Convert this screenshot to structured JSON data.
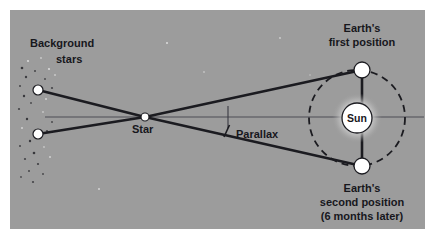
{
  "figure": {
    "title_visible": false,
    "panel": {
      "x": 10,
      "y": 10,
      "width": 415,
      "height": 219,
      "fill": "#9c9c9c",
      "margin_fill": "#ffffff"
    },
    "colors": {
      "background_gray": "#9c9c9c",
      "line_dark": "#1b1b20",
      "axis_gray": "#4d4d55",
      "body_white": "#ffffff",
      "text_dark": "#17171c",
      "sun_glow": "#c9c9c9",
      "margin_white": "#ffffff"
    },
    "labels": {
      "background_stars_line1": "Background",
      "background_stars_line2": "stars",
      "star": "Star",
      "parallax": "Parallax",
      "sun": "Sun",
      "earth_first_line1": "Earth's",
      "earth_first_line2": "first position",
      "earth_second_line1": "Earth's",
      "earth_second_line2": "second position",
      "earth_second_line3": "(6 months later)"
    },
    "bodies": {
      "sun": {
        "cx": 357,
        "cy": 118,
        "r": 15,
        "glow_r": 25,
        "label": "Sun"
      },
      "earth_first": {
        "cx": 362,
        "cy": 70,
        "r": 8
      },
      "earth_second": {
        "cx": 362,
        "cy": 166,
        "r": 8
      },
      "star": {
        "cx": 145,
        "cy": 117,
        "r": 4
      },
      "background_star_upper": {
        "cx": 38,
        "cy": 90,
        "r": 5
      },
      "background_star_lower": {
        "cx": 38,
        "cy": 134,
        "r": 5
      }
    },
    "orbit": {
      "cx": 357,
      "cy": 118,
      "r": 48,
      "style": "dashed",
      "dash_pattern": "7 5",
      "stroke_width": 1.8
    },
    "sight_lines": [
      {
        "name": "upper-sight-line",
        "x1": 38,
        "y1": 90,
        "x2": 362,
        "y2": 70,
        "via_x": 145,
        "via_y": 117
      },
      {
        "name": "lower-sight-line",
        "x1": 38,
        "y1": 134,
        "x2": 362,
        "y2": 166,
        "via_x": 145,
        "via_y": 117
      }
    ],
    "axis": {
      "name": "horizontal-axis",
      "x1": 45,
      "y1": 117,
      "x2": 424,
      "y2": 117,
      "stroke_width": 1.2
    },
    "earth_connector": {
      "x1": 362,
      "y1": 70,
      "x2": 362,
      "y2": 166,
      "stroke_width": 2.6
    },
    "parallax_marker": {
      "tick_x": 228,
      "tick_y1": 106,
      "tick_y2": 128,
      "leader_x1": 224,
      "leader_y1": 137,
      "leader_x2": 229,
      "leader_y2": 126
    },
    "scatter_stars": [
      {
        "cx": 28,
        "cy": 61,
        "r": 1.1
      },
      {
        "cx": 41,
        "cy": 58,
        "r": 0.9
      },
      {
        "cx": 22,
        "cy": 68,
        "r": 1.3
      },
      {
        "cx": 35,
        "cy": 71,
        "r": 1.0
      },
      {
        "cx": 49,
        "cy": 69,
        "r": 1.1
      },
      {
        "cx": 26,
        "cy": 77,
        "r": 1.2
      },
      {
        "cx": 45,
        "cy": 79,
        "r": 0.9
      },
      {
        "cx": 55,
        "cy": 75,
        "r": 1.0
      },
      {
        "cx": 20,
        "cy": 86,
        "r": 1.0
      },
      {
        "cx": 52,
        "cy": 88,
        "r": 1.1
      },
      {
        "cx": 24,
        "cy": 96,
        "r": 1.2
      },
      {
        "cx": 46,
        "cy": 99,
        "r": 1.0
      },
      {
        "cx": 31,
        "cy": 103,
        "r": 0.9
      },
      {
        "cx": 19,
        "cy": 109,
        "r": 1.1
      },
      {
        "cx": 43,
        "cy": 112,
        "r": 0.9
      },
      {
        "cx": 27,
        "cy": 119,
        "r": 1.2
      },
      {
        "cx": 52,
        "cy": 122,
        "r": 1.0
      },
      {
        "cx": 22,
        "cy": 128,
        "r": 1.0
      },
      {
        "cx": 47,
        "cy": 131,
        "r": 1.1
      },
      {
        "cx": 30,
        "cy": 141,
        "r": 1.2
      },
      {
        "cx": 20,
        "cy": 146,
        "r": 1.0
      },
      {
        "cx": 44,
        "cy": 147,
        "r": 0.9
      },
      {
        "cx": 34,
        "cy": 153,
        "r": 1.3
      },
      {
        "cx": 25,
        "cy": 159,
        "r": 1.1
      },
      {
        "cx": 50,
        "cy": 157,
        "r": 1.0
      },
      {
        "cx": 38,
        "cy": 164,
        "r": 1.1
      },
      {
        "cx": 29,
        "cy": 171,
        "r": 1.0
      },
      {
        "cx": 21,
        "cy": 177,
        "r": 0.9
      },
      {
        "cx": 43,
        "cy": 174,
        "r": 1.0
      },
      {
        "cx": 33,
        "cy": 182,
        "r": 1.1
      },
      {
        "cx": 167,
        "cy": 43,
        "r": 1.0
      },
      {
        "cx": 280,
        "cy": 38,
        "r": 0.9
      },
      {
        "cx": 204,
        "cy": 72,
        "r": 0.9
      },
      {
        "cx": 99,
        "cy": 189,
        "r": 1.0
      },
      {
        "cx": 310,
        "cy": 75,
        "r": 0.8
      }
    ],
    "label_positions": {
      "background_stars_line1": {
        "x": 30,
        "y": 47
      },
      "background_stars_line2": {
        "x": 56,
        "y": 63
      },
      "star": {
        "x": 132,
        "y": 132
      },
      "parallax": {
        "x": 236,
        "y": 137
      },
      "sun": {
        "x": 357,
        "y": 122
      },
      "earth_first_line1": {
        "x": 362,
        "y": 31
      },
      "earth_first_line2": {
        "x": 362,
        "y": 45
      },
      "earth_second_line1": {
        "x": 362,
        "y": 191
      },
      "earth_second_line2": {
        "x": 362,
        "y": 205
      },
      "earth_second_line3": {
        "x": 362,
        "y": 219
      }
    },
    "diagram_meta": {
      "type": "astronomy-concept-diagram",
      "concept": "stellar parallax",
      "description": "Two lines of sight from Earth at opposite points of its orbit converge at a nearby star and extend to different background stars, illustrating the parallax shift over six months."
    }
  }
}
